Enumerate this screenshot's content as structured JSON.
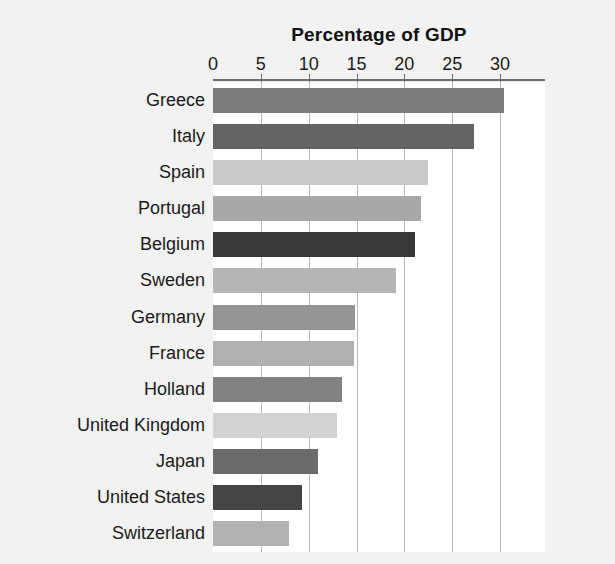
{
  "chart_data": {
    "type": "bar",
    "orientation": "horizontal",
    "title": "Percentage of GDP",
    "xlabel": "",
    "ylabel": "",
    "xlim": [
      0,
      34.7
    ],
    "xticks": [
      0,
      5,
      10,
      15,
      20,
      25,
      30
    ],
    "xtick_labels": [
      "0",
      "5",
      "10",
      "15",
      "20",
      "25",
      "30"
    ],
    "grid": "vertical",
    "legend": "none",
    "categories": [
      "Greece",
      "Italy",
      "Spain",
      "Portugal",
      "Belgium",
      "Sweden",
      "Germany",
      "France",
      "Holland",
      "United Kingdom",
      "Japan",
      "United States",
      "Switzerland"
    ],
    "values": [
      30.4,
      27.3,
      22.5,
      21.7,
      21.1,
      19.1,
      14.8,
      14.7,
      13.5,
      13.0,
      11.0,
      9.3,
      7.9
    ],
    "bar_colors": [
      "#7d7d7d",
      "#636363",
      "#c9c9c9",
      "#a8a8a8",
      "#383838",
      "#b5b5b5",
      "#959595",
      "#b0b0b0",
      "#828282",
      "#d2d2d2",
      "#6b6b6b",
      "#454545",
      "#b2b2b2"
    ]
  },
  "style": {
    "page_background": "#f2f2f2",
    "plot_background": "#ffffff",
    "gridline_color": "#b9b9b9",
    "axis_rule_color": "#6e6e6e",
    "text_color": "#1a1a1a"
  }
}
